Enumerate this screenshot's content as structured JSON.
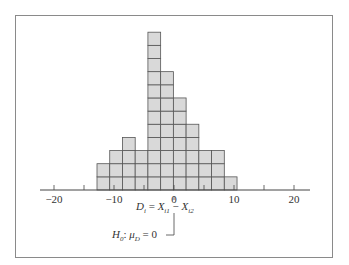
{
  "chart_data": {
    "type": "bar",
    "title": "",
    "xlabel": "D_i = X_i1 − X_i2",
    "ylabel": "",
    "bin_edges_px_note": "histogram of paired differences, unit-square (dot) style",
    "categories": [
      "-12.5",
      "-10.4",
      "-8.3",
      "-6.2",
      "-4.1",
      "-2.0",
      "0.1",
      "2.2",
      "4.3",
      "6.4",
      "8.5"
    ],
    "values": [
      2,
      3,
      4,
      3,
      12,
      9,
      7,
      5,
      3,
      3,
      1
    ],
    "xlim": [
      -22,
      23
    ],
    "ylim": [
      0,
      12
    ],
    "xticks": [
      -20,
      -15,
      -10,
      -5,
      0,
      5,
      10,
      15,
      20
    ],
    "xtick_labels": [
      "−20",
      "",
      "−10",
      "",
      "0",
      "",
      "10",
      "",
      "20"
    ],
    "grid": false,
    "legend": null,
    "annotations": [
      {
        "text": "D_i = X_i1 − X_i2",
        "anchor_x": 0
      },
      {
        "text": "H_0: μ_D = 0",
        "anchor_x": 0
      }
    ],
    "colors": {
      "bar_fill": "#d9d9d9",
      "bar_edge": "#555555",
      "axis": "#444444"
    }
  },
  "annotation": {
    "d_main": "D",
    "d_sub": "i",
    "eq": " = ",
    "x1_main": "X",
    "x1_sub": "i1",
    "minus": " − ",
    "x2_main": "X",
    "x2_sub": "i2",
    "h_main": "H",
    "h_sub": "0",
    "h_colon": ": ",
    "mu": "μ",
    "mu_sub": "D",
    "h_eq": " = 0"
  }
}
